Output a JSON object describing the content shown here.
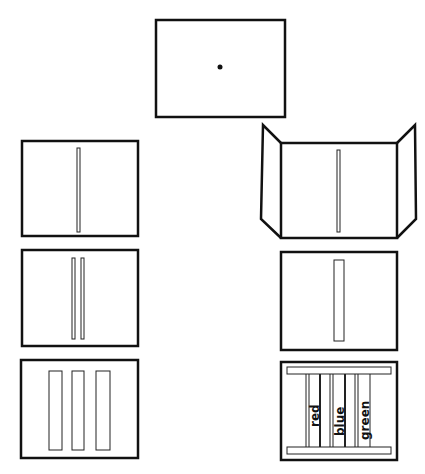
{
  "diagram": {
    "stroke_color": "#111111",
    "background": "#ffffff",
    "panels": [
      {
        "id": "top-screen",
        "feature": "fixation dot"
      },
      {
        "id": "left-1",
        "feature": "single narrow slit"
      },
      {
        "id": "left-2",
        "feature": "two narrow slits"
      },
      {
        "id": "left-3",
        "feature": "three wide bars"
      },
      {
        "id": "right-1",
        "feature": "triptych screen with single slit"
      },
      {
        "id": "right-2",
        "feature": "single wide bar"
      },
      {
        "id": "right-3",
        "feature": "labeled color bars between rails"
      }
    ],
    "color_labels": [
      "red",
      "blue",
      "green"
    ]
  }
}
